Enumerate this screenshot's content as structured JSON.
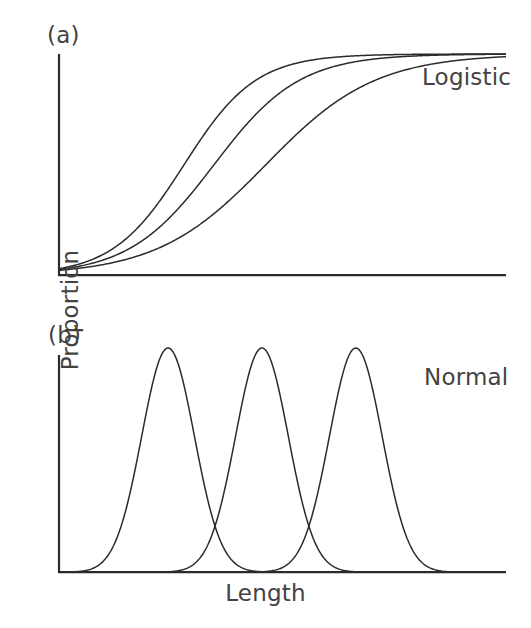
{
  "figure": {
    "axis_labels": {
      "x": "Length",
      "y": "Proportion"
    },
    "stroke_color": "#2b2b2b",
    "axis_color": "#2b2b2b",
    "background": "#ffffff"
  },
  "panels": [
    {
      "tag": "(a)",
      "series_label": "Logistic",
      "chart_data": {
        "type": "line",
        "title": "Logistic",
        "xlabel": "",
        "ylabel": "Proportion",
        "xlim": [
          0,
          100
        ],
        "ylim": [
          0,
          1
        ],
        "grid": false,
        "legend": "inline-right",
        "annotations": [
          "(a)",
          "Logistic"
        ],
        "x_ticklabels": [],
        "y_ticklabels": [],
        "series": [
          {
            "name": "curve-1",
            "model": "logistic",
            "midpoint_x": 28.0,
            "steepness": 0.125,
            "asymptote": 1.0
          },
          {
            "name": "curve-2",
            "model": "logistic",
            "midpoint_x": 34.7,
            "steepness": 0.105,
            "asymptote": 1.0
          },
          {
            "name": "curve-3",
            "model": "logistic",
            "midpoint_x": 46.3,
            "steepness": 0.082,
            "asymptote": 1.0
          }
        ]
      }
    },
    {
      "tag": "(b)",
      "series_label": "Normal",
      "chart_data": {
        "type": "line",
        "title": "Normal",
        "xlabel": "Length",
        "ylabel": "Proportion",
        "xlim": [
          0,
          100
        ],
        "ylim": [
          0,
          1
        ],
        "grid": false,
        "legend": "inline-right",
        "annotations": [
          "(b)",
          "Normal"
        ],
        "x_ticklabels": [],
        "y_ticklabels": [],
        "series": [
          {
            "name": "curve-1",
            "model": "normal",
            "mean_x": 24.4,
            "sigma": 5.9,
            "peak_height": 1.0
          },
          {
            "name": "curve-2",
            "model": "normal",
            "mean_x": 45.4,
            "sigma": 5.9,
            "peak_height": 1.0
          },
          {
            "name": "curve-3",
            "model": "normal",
            "mean_x": 66.4,
            "sigma": 5.9,
            "peak_height": 1.0
          }
        ]
      }
    }
  ]
}
